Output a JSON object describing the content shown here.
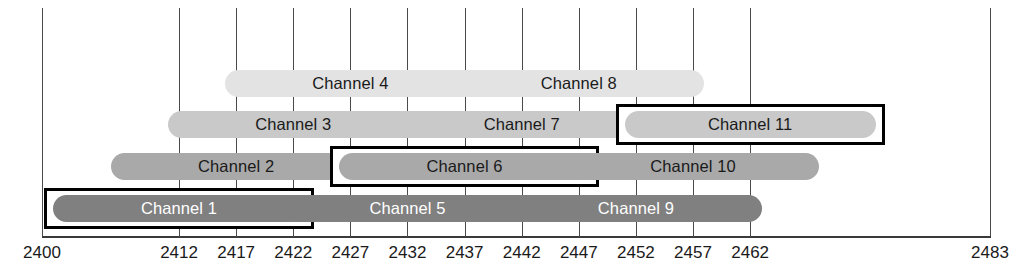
{
  "chart_data": {
    "type": "bar",
    "orientation": "horizontal",
    "xlabel": "Frequency (MHz)",
    "ylabel": "",
    "xlim": [
      2400,
      2483
    ],
    "grid": true,
    "legend": false,
    "channel_width_mhz": 22,
    "tick_values": [
      2400,
      2412,
      2417,
      2422,
      2427,
      2432,
      2437,
      2442,
      2447,
      2452,
      2457,
      2462,
      2483
    ],
    "tick_labels": [
      "2400",
      "2412",
      "2417",
      "2422",
      "2427",
      "2432",
      "2437",
      "2442",
      "2447",
      "2452",
      "2457",
      "2462",
      "2483"
    ],
    "gridline_values": [
      2412,
      2417,
      2422,
      2427,
      2432,
      2437,
      2442,
      2447,
      2452,
      2457,
      2462
    ],
    "row_colors": [
      "#e3e3e3",
      "#c9c9c9",
      "#a9a9a9",
      "#808080"
    ],
    "highlight_color": "#000000",
    "series": [
      {
        "name": "Channel 4",
        "label": "Channel 4",
        "center": 2427,
        "start": 2416,
        "end": 2438,
        "row": 0,
        "tone": "tone-1",
        "highlighted": false
      },
      {
        "name": "Channel 8",
        "label": "Channel 8",
        "center": 2447,
        "start": 2436,
        "end": 2458,
        "row": 0,
        "tone": "tone-1",
        "highlighted": false
      },
      {
        "name": "Channel 3",
        "label": "Channel 3",
        "center": 2422,
        "start": 2411,
        "end": 2433,
        "row": 1,
        "tone": "tone-2",
        "highlighted": false
      },
      {
        "name": "Channel 7",
        "label": "Channel 7",
        "center": 2442,
        "start": 2431,
        "end": 2453,
        "row": 1,
        "tone": "tone-2",
        "highlighted": false
      },
      {
        "name": "Channel 11",
        "label": "Channel 11",
        "center": 2462,
        "start": 2451,
        "end": 2473,
        "row": 1,
        "tone": "tone-2",
        "highlighted": true
      },
      {
        "name": "Channel 2",
        "label": "Channel 2",
        "center": 2417,
        "start": 2406,
        "end": 2428,
        "row": 2,
        "tone": "tone-3",
        "highlighted": false
      },
      {
        "name": "Channel 6",
        "label": "Channel 6",
        "center": 2437,
        "start": 2426,
        "end": 2448,
        "row": 2,
        "tone": "tone-3",
        "highlighted": true
      },
      {
        "name": "Channel 10",
        "label": "Channel 10",
        "center": 2457,
        "start": 2446,
        "end": 2468,
        "row": 2,
        "tone": "tone-3",
        "highlighted": false
      },
      {
        "name": "Channel 1",
        "label": "Channel 1",
        "center": 2412,
        "start": 2401,
        "end": 2423,
        "row": 3,
        "tone": "tone-4",
        "highlighted": true
      },
      {
        "name": "Channel 5",
        "label": "Channel 5",
        "center": 2432,
        "start": 2421,
        "end": 2443,
        "row": 3,
        "tone": "tone-4",
        "highlighted": false
      },
      {
        "name": "Channel 9",
        "label": "Channel 9",
        "center": 2452,
        "start": 2441,
        "end": 2463,
        "row": 3,
        "tone": "tone-4",
        "highlighted": false
      }
    ]
  },
  "geometry": {
    "plot_left_px": 42,
    "plot_right_px": 990,
    "freq_min": 2400,
    "freq_max": 2483,
    "row_tops_px": [
      70,
      111,
      153,
      195
    ],
    "bar_height_px": 27
  }
}
